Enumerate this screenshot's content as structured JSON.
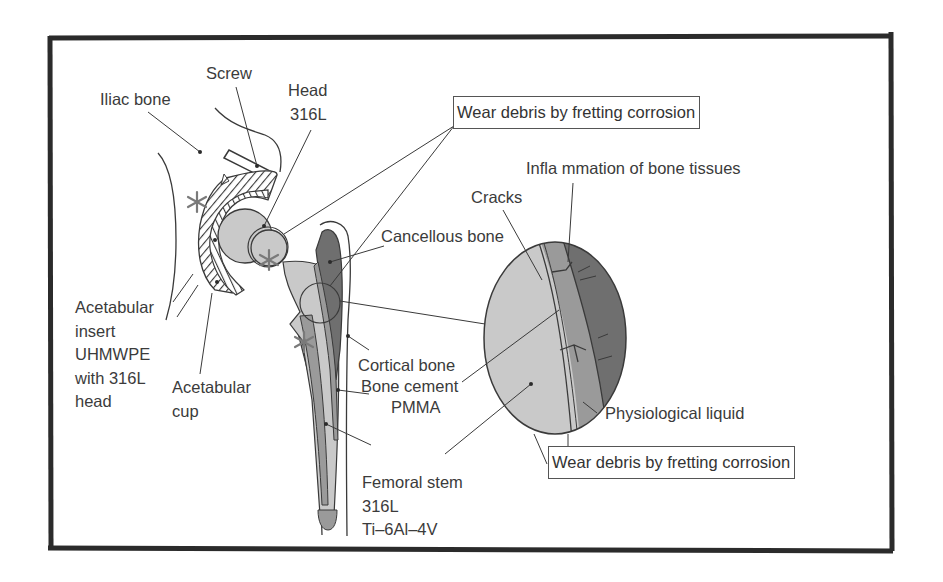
{
  "figure": {
    "colors": {
      "frame": "#2b2b2b",
      "stroke": "#3a3a3a",
      "implant_light_gray": "#c9c9c9",
      "bone_dark_gray": "#6f6f6f",
      "cement_mid_gray": "#9a9a9a",
      "asterisk": "#7a7a7a",
      "text": "#3b3b3b"
    }
  },
  "labels": {
    "iliac_bone": "Iliac bone",
    "screw": "Screw",
    "head": "Head",
    "head_material": "316L",
    "acetabular_insert": "Acetabular\ninsert\nUHMWPE\nwith 316L\nhead",
    "acetabular_cup": "Acetabular\ncup",
    "cancellous_bone": "Cancellous bone",
    "cortical_bone": "Cortical bone",
    "bone_cement": "Bone cement",
    "bone_cement_material": "PMMA",
    "femoral_stem": "Femoral stem",
    "femoral_stem_material_1": "316L",
    "femoral_stem_material_2": "Ti–6Al–4V",
    "cracks": "Cracks",
    "inflammation": "Infla mmation of bone tissues",
    "physiological_liquid": "Physiological liquid"
  },
  "callouts": {
    "wear_debris_top": "Wear debris by fretting corrosion",
    "wear_debris_bottom": "Wear debris by fretting corrosion"
  }
}
